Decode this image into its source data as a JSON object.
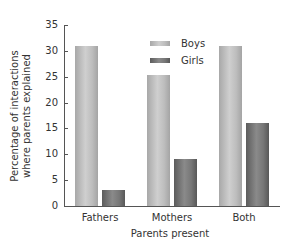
{
  "chart_data": {
    "type": "bar",
    "title": "",
    "xlabel": "Parents present",
    "ylabel": "Percentage of interactions where parents explained",
    "ylabel_lines": [
      "Percentage of interactions",
      "where parents explained"
    ],
    "categories": [
      "Fathers",
      "Mothers",
      "Both"
    ],
    "series": [
      {
        "name": "Boys",
        "values": [
          31,
          25.3,
          31
        ],
        "color": "#bdbdbd"
      },
      {
        "name": "Girls",
        "values": [
          3,
          9.1,
          16
        ],
        "color": "#777777"
      }
    ],
    "ylim": [
      0,
      35
    ],
    "yticks": [
      0,
      5,
      10,
      15,
      20,
      25,
      30,
      35
    ],
    "grid": false,
    "legend_position": "upper center"
  }
}
